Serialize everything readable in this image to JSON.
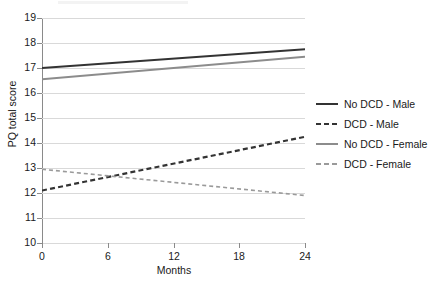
{
  "chart_data": {
    "type": "line",
    "title": "",
    "xlabel": "Months",
    "ylabel": "PQ total score",
    "xlim": [
      0,
      24
    ],
    "ylim": [
      10,
      19
    ],
    "x_ticks": [
      0,
      6,
      12,
      18,
      24
    ],
    "y_ticks": [
      10,
      11,
      12,
      13,
      14,
      15,
      16,
      17,
      18,
      19
    ],
    "grid": true,
    "legend_position": "right",
    "x": [
      0,
      24
    ],
    "series": [
      {
        "name": "No DCD - Male",
        "values": [
          17.0,
          17.75
        ],
        "color": "#333333",
        "style": "solid",
        "width": 2.2
      },
      {
        "name": "DCD - Male",
        "values": [
          12.1,
          14.25
        ],
        "color": "#333333",
        "style": "dashed",
        "width": 2.2
      },
      {
        "name": "No DCD - Female",
        "values": [
          16.55,
          17.45
        ],
        "color": "#8c8c8c",
        "style": "solid",
        "width": 1.8
      },
      {
        "name": "DCD - Female",
        "values": [
          12.95,
          11.9
        ],
        "color": "#9a9a9a",
        "style": "dashed",
        "width": 1.6
      }
    ]
  },
  "axes": {
    "x_tick_labels": [
      "0",
      "6",
      "12",
      "18",
      "24"
    ],
    "y_tick_labels": [
      "10",
      "11",
      "12",
      "13",
      "14",
      "15",
      "16",
      "17",
      "18",
      "19"
    ],
    "x_title": "Months",
    "y_title": "PQ total score"
  },
  "legend": {
    "items": [
      {
        "label": "No DCD - Male"
      },
      {
        "label": "DCD - Male"
      },
      {
        "label": "No DCD - Female"
      },
      {
        "label": "DCD - Female"
      }
    ]
  },
  "colors": {
    "grid": "#d9d9d9",
    "axis": "#8a8a8a",
    "dark_series": "#333333",
    "light_series": "#8c8c8c",
    "background": "#ffffff"
  }
}
